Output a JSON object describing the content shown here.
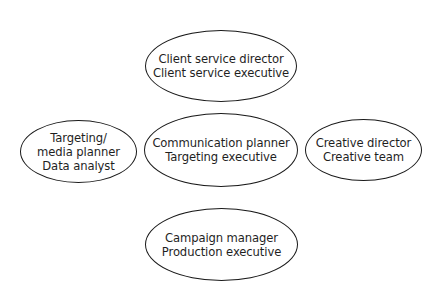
{
  "diagram": {
    "type": "role-cluster",
    "stroke_color": "#1a1a1a",
    "text_color": "#1f1f1f",
    "background": "#ffffff",
    "nodes": [
      {
        "id": "top",
        "position": "top",
        "lines": [
          "Client service director",
          "Client service executive"
        ]
      },
      {
        "id": "left",
        "position": "left",
        "lines": [
          "Targeting/",
          "media planner",
          "Data analyst"
        ]
      },
      {
        "id": "center",
        "position": "center",
        "lines": [
          "Communication planner",
          "Targeting executive"
        ]
      },
      {
        "id": "right",
        "position": "right",
        "lines": [
          "Creative director",
          "Creative team"
        ]
      },
      {
        "id": "bottom",
        "position": "bottom",
        "lines": [
          "Campaign manager",
          "Production executive"
        ]
      }
    ]
  }
}
